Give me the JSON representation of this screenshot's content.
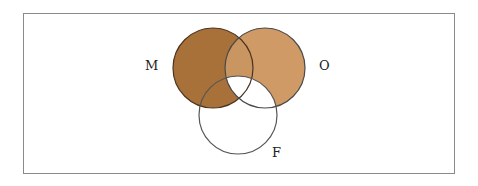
{
  "diagram": {
    "type": "venn",
    "sets": [
      {
        "id": "M",
        "label": "M",
        "cx": 213,
        "cy": 68,
        "r": 40
      },
      {
        "id": "O",
        "label": "O",
        "cx": 265,
        "cy": 68,
        "r": 40
      },
      {
        "id": "F",
        "label": "F",
        "cx": 238,
        "cy": 115,
        "r": 39
      }
    ],
    "shaded_regions": [
      "M only",
      "O only",
      "M∩O not F",
      "M∩F not O"
    ],
    "unshaded_regions": [
      "F only",
      "O∩F not M",
      "M∩O∩F"
    ],
    "colors": {
      "M": "#a9713a",
      "O": "#cf9a66",
      "MO": "#c99560",
      "outline": "#3a3a3a",
      "frame": "#8a8a8a"
    }
  },
  "labels": {
    "M": "M",
    "O": "O",
    "F": "F"
  }
}
